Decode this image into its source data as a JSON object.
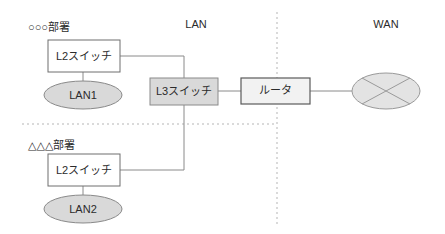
{
  "diagram": {
    "zones": [
      {
        "id": "lan",
        "label": "LAN"
      },
      {
        "id": "wan",
        "label": "WAN"
      }
    ],
    "groups": [
      {
        "id": "dept-upper",
        "label": "○○○部署"
      },
      {
        "id": "dept-lower",
        "label": "△△△部署"
      }
    ],
    "nodes": [
      {
        "id": "l2-switch-upper",
        "label": "L2スイッチ",
        "shape": "rect",
        "fill": "#ffffff"
      },
      {
        "id": "l2-switch-lower",
        "label": "L2スイッチ",
        "shape": "rect",
        "fill": "#ffffff"
      },
      {
        "id": "l3-switch",
        "label": "L3スイッチ",
        "shape": "rect",
        "fill": "#d9d9d9"
      },
      {
        "id": "router",
        "label": "ルータ",
        "shape": "rect",
        "fill": "#f2f2f2"
      },
      {
        "id": "lan1",
        "label": "LAN1",
        "shape": "ellipse",
        "fill": "#d9d9d9"
      },
      {
        "id": "lan2",
        "label": "LAN2",
        "shape": "ellipse",
        "fill": "#d9d9d9"
      },
      {
        "id": "wan-cloud",
        "label": "",
        "shape": "ellipse-cross",
        "fill": "#e3e3e3"
      }
    ],
    "colors": {
      "text": "#2b2b2b",
      "line": "#8a8a8a",
      "divider": "#b5b5b5",
      "fill_gray": "#d9d9d9",
      "fill_light": "#f2f2f2",
      "background": "#ffffff"
    }
  }
}
